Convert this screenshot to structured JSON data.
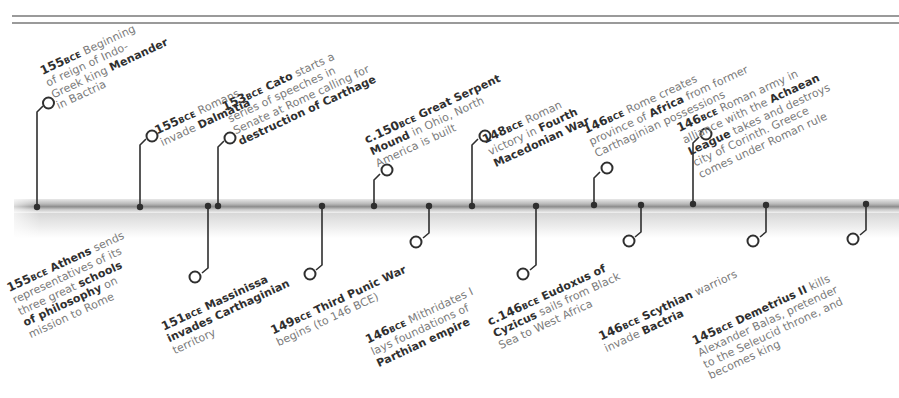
{
  "timeline": {
    "accent_color": "#2f2f2f",
    "text_color": "#7a7a7a",
    "events_above": [
      {
        "year": "155",
        "era": "BCE",
        "lines": [
          "Beginning",
          "of reign of Indo-",
          "Greek king ",
          "in Bactria"
        ],
        "bold": "Menander",
        "x": 37
      },
      {
        "year": "155",
        "era": "BCE",
        "lines": [
          "Romans",
          "invade "
        ],
        "bold": "Dalmatia",
        "x": 140
      },
      {
        "year": "153",
        "era": "BCE",
        "lines": [
          "starts a",
          "series of speeches in",
          "Senate at Rome calling for"
        ],
        "bold_name": "Cato",
        "bold": "destruction of Carthage",
        "x": 218
      },
      {
        "year": "c.150",
        "era": "BCE",
        "lines": [
          "in Ohio, North",
          "America is built"
        ],
        "bold": "Great Serpent Mound",
        "x": 374
      },
      {
        "year": "148",
        "era": "BCE",
        "lines": [
          "Roman",
          "victory in "
        ],
        "bold": "Fourth Macedonian War",
        "x": 472
      },
      {
        "year": "146",
        "era": "BCE",
        "lines": [
          "Rome creates",
          "province of ",
          "from former",
          "Carthaginian possessions"
        ],
        "bold": "Africa",
        "x": 594
      },
      {
        "year": "146",
        "era": "BCE",
        "lines": [
          "Roman army in",
          "alliance with the ",
          "takes and destroys",
          "city of Corinth. Greece",
          "comes under Roman rule"
        ],
        "bold": "Achaean League",
        "x": 693
      }
    ],
    "events_below": [
      {
        "year": "155",
        "era": "BCE",
        "lines": [
          "sends",
          "representatives of its",
          "three great ",
          "on",
          "mission to Rome"
        ],
        "bold_name": "Athens",
        "bold": "schools of philosophy",
        "x": 208
      },
      {
        "year": "151",
        "era": "BCE",
        "lines": [],
        "bold_name": "Massinissa",
        "bold": "invades Carthaginian",
        "tail": "territory",
        "x": 322
      },
      {
        "year": "149",
        "era": "BCE",
        "lines": [
          "begins (to 146 BCE)"
        ],
        "bold": "Third Punic War",
        "x": 429
      },
      {
        "year": "146",
        "era": "BCE",
        "lines": [
          "Mithridates I",
          "lays foundations of"
        ],
        "bold": "Parthian empire",
        "x": 535
      },
      {
        "year": "c.146",
        "era": "BCE",
        "lines": [
          "sails from Black",
          "Sea to West Africa"
        ],
        "bold_name": "Eudoxus of",
        "bold": "Cyzicus",
        "x": 641
      },
      {
        "year": "146",
        "era": "BCE",
        "lines": [
          "warriors",
          "invade "
        ],
        "bold_name": "Scythian",
        "bold": "Bactria",
        "x": 766
      },
      {
        "year": "145",
        "era": "BCE",
        "lines": [
          "kills",
          "Alexander Balas, pretender",
          "to the Seleucid throne, and",
          "becomes king"
        ],
        "bold_name": "Demetrius II",
        "x": 866
      }
    ]
  },
  "text": {
    "a0_year": "155",
    "a0_era": "BCE",
    "a0_l1": " Beginning",
    "a0_l2": "of reign of Indo-",
    "a0_l3": "Greek king ",
    "a0_b": "Menander",
    "a0_l4": "in Bactria",
    "a1_year": "155",
    "a1_era": "BCE",
    "a1_l1": " Romans",
    "a1_l2": "invade ",
    "a1_b": "Dalmatia",
    "a2_year": "153",
    "a2_era": "BCE",
    "a2_b1": " Cato",
    "a2_l1": " starts a",
    "a2_l2": "series of speeches in",
    "a2_l3": "Senate at Rome calling for",
    "a2_b2": "destruction of Carthage",
    "a3_year": "c.150",
    "a3_era": "BCE",
    "a3_b1": " Great Serpent",
    "a3_b2": "Mound",
    "a3_l1": " in Ohio, North",
    "a3_l2": "America is built",
    "a4_year": "148",
    "a4_era": "BCE",
    "a4_l1": " Roman",
    "a4_l2": "victory in ",
    "a4_b1": "Fourth",
    "a4_b2": "Macedonian War",
    "a5_year": "146",
    "a5_era": "BCE",
    "a5_l1": " Rome creates",
    "a5_l2": "province of ",
    "a5_b": "Africa",
    "a5_l3": " from former",
    "a5_l4": "Carthaginian possessions",
    "a6_year": "146",
    "a6_era": "BCE",
    "a6_l1": " Roman army in",
    "a6_l2": "alliance with the ",
    "a6_b1": "Achaean",
    "a6_b2": "League",
    "a6_l3": " takes and destroys",
    "a6_l4": "city of Corinth. Greece",
    "a6_l5": "comes under Roman rule",
    "b0_year": "155",
    "b0_era": "BCE",
    "b0_b1": " Athens",
    "b0_l1": " sends",
    "b0_l2": "representatives of its",
    "b0_l3": "three great ",
    "b0_b2": "schools",
    "b0_b3": "of philosophy",
    "b0_l4": " on",
    "b0_l5": "mission to Rome",
    "b1_year": "151",
    "b1_era": "BCE",
    "b1_b1": " Massinissa",
    "b1_b2": "invades Carthaginian",
    "b1_l1": "territory",
    "b2_year": "149",
    "b2_era": "BCE",
    "b2_b": " Third Punic War",
    "b2_l1": "begins (to 146 BCE)",
    "b3_year": "146",
    "b3_era": "BCE",
    "b3_l1": " Mithridates I",
    "b3_l2": "lays foundations of",
    "b3_b": "Parthian empire",
    "b4_year": "c.146",
    "b4_era": "BCE",
    "b4_b1": " Eudoxus of",
    "b4_b2": "Cyzicus",
    "b4_l1": " sails from Black",
    "b4_l2": "Sea to West Africa",
    "b5_year": "146",
    "b5_era": "BCE",
    "b5_b1": " Scythian",
    "b5_l1": " warriors",
    "b5_l2": "invade ",
    "b5_b2": "Bactria",
    "b6_year": "145",
    "b6_era": "BCE",
    "b6_b1": " Demetrius II",
    "b6_l1": " kills",
    "b6_l2": "Alexander Balas, pretender",
    "b6_l3": "to the Seleucid throne, and",
    "b6_l4": "becomes king"
  }
}
